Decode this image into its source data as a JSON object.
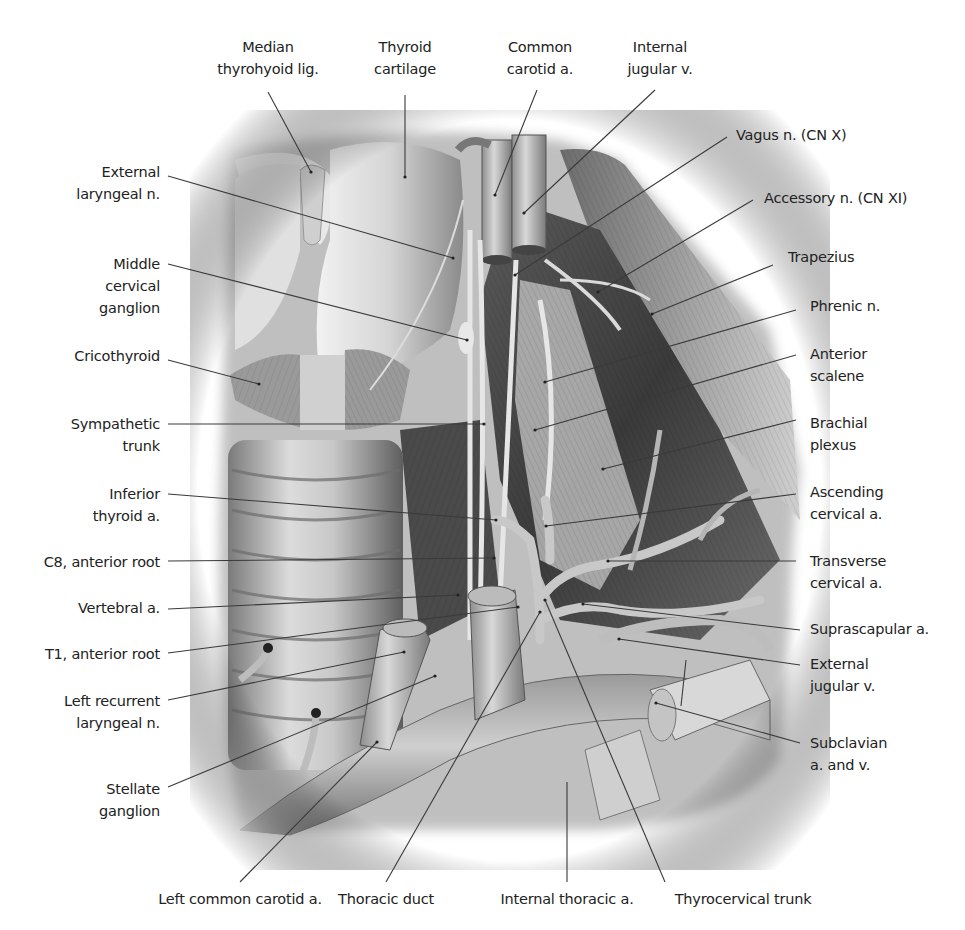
{
  "figure": {
    "style": "grayscale anatomical illustration",
    "background_color": "#ffffff",
    "leader_line_color": "#3a3a3a"
  },
  "labels": {
    "top": [
      {
        "id": "median-thyrohyoid-lig",
        "text": "Median\nthyrohyoid lig."
      },
      {
        "id": "thyroid-cartilage",
        "text": "Thyroid\ncartilage"
      },
      {
        "id": "common-carotid-a",
        "text": "Common\ncarotid a."
      },
      {
        "id": "internal-jugular-v",
        "text": "Internal\njugular v."
      }
    ],
    "left": [
      {
        "id": "external-laryngeal-n",
        "text": "External\nlaryngeal n."
      },
      {
        "id": "middle-cervical-ganglion",
        "text": "Middle\ncervical\nganglion"
      },
      {
        "id": "cricothyroid",
        "text": "Cricothyroid"
      },
      {
        "id": "sympathetic-trunk",
        "text": "Sympathetic\ntrunk"
      },
      {
        "id": "inferior-thyroid-a",
        "text": "Inferior\nthyroid a."
      },
      {
        "id": "c8-anterior-root",
        "text": "C8, anterior root"
      },
      {
        "id": "vertebral-a",
        "text": "Vertebral a."
      },
      {
        "id": "t1-anterior-root",
        "text": "T1, anterior root"
      },
      {
        "id": "left-recurrent-laryngeal-n",
        "text": "Left recurrent\nlaryngeal n."
      },
      {
        "id": "stellate-ganglion",
        "text": "Stellate\nganglion"
      }
    ],
    "right": [
      {
        "id": "vagus-n",
        "text": "Vagus n. (CN X)"
      },
      {
        "id": "accessory-n",
        "text": "Accessory n. (CN XI)"
      },
      {
        "id": "trapezius",
        "text": "Trapezius"
      },
      {
        "id": "phrenic-n",
        "text": "Phrenic n."
      },
      {
        "id": "anterior-scalene",
        "text": "Anterior\nscalene"
      },
      {
        "id": "brachial-plexus",
        "text": "Brachial\nplexus"
      },
      {
        "id": "ascending-cervical-a",
        "text": "Ascending\ncervical a."
      },
      {
        "id": "transverse-cervical-a",
        "text": "Transverse\ncervical a."
      },
      {
        "id": "suprascapular-a",
        "text": "Suprascapular a."
      },
      {
        "id": "external-jugular-v",
        "text": "External\njugular v."
      },
      {
        "id": "subclavian-a-and-v",
        "text": "Subclavian\na. and v."
      }
    ],
    "bottom": [
      {
        "id": "left-common-carotid-a",
        "text": "Left common carotid a."
      },
      {
        "id": "thoracic-duct",
        "text": "Thoracic duct"
      },
      {
        "id": "internal-thoracic-a",
        "text": "Internal thoracic a."
      },
      {
        "id": "thyrocervical-trunk",
        "text": "Thyrocervical trunk"
      }
    ]
  }
}
